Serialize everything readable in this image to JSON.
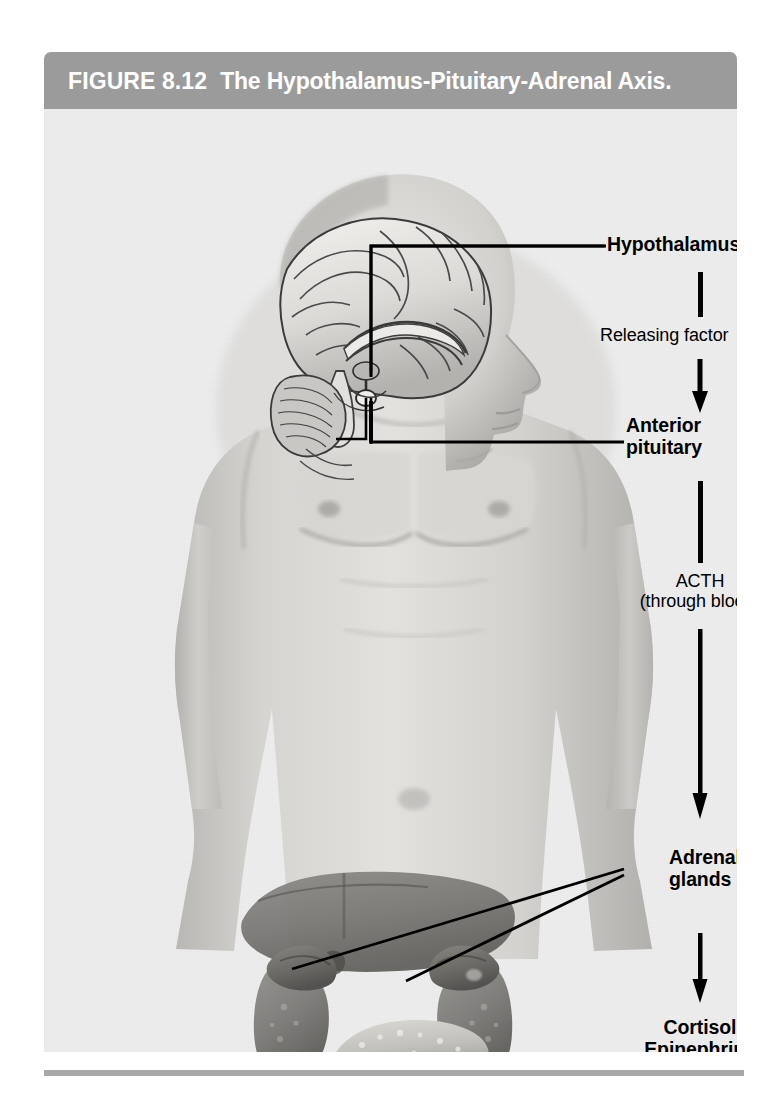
{
  "figure": {
    "number": "FIGURE 8.12",
    "title": "The Hypothalamus-Pituitary-Adrenal Axis.",
    "title_bar_color": "#9b9b9b",
    "background_color": "#eeeeee",
    "rule_color": "#a8a8a8"
  },
  "flow": {
    "steps": [
      {
        "id": "hypothalamus",
        "label": "Hypothalamus",
        "style": "bold",
        "kind": "organ"
      },
      {
        "id": "releasing-factor",
        "label": "Releasing factor",
        "style": "plain",
        "kind": "signal"
      },
      {
        "id": "anterior-pituitary",
        "label": "Anterior\npituitary",
        "style": "bold",
        "kind": "organ"
      },
      {
        "id": "acth",
        "label": "ACTH\n(through blood)",
        "style": "plain",
        "kind": "signal"
      },
      {
        "id": "adrenal-glands",
        "label": "Adrenal\nglands",
        "style": "bold",
        "kind": "organ"
      },
      {
        "id": "hormones",
        "label": "Cortisol\nEpinephrine\nNorepinephrine",
        "style": "bold",
        "kind": "output"
      }
    ],
    "connectors": [
      {
        "id": "hypothalamus-to-releasing-factor",
        "type": "bar"
      },
      {
        "id": "releasing-factor-to-pituitary",
        "type": "arrow"
      },
      {
        "id": "pituitary-to-acth",
        "type": "bar"
      },
      {
        "id": "acth-to-adrenal",
        "type": "arrow"
      },
      {
        "id": "adrenal-to-hormones",
        "type": "arrow"
      }
    ]
  },
  "leaders": [
    {
      "id": "hypothalamus-leader",
      "target": "hypothalamus"
    },
    {
      "id": "anterior-pituitary-leader",
      "target": "anterior pituitary"
    },
    {
      "id": "adrenal-gland-leader-left",
      "target": "left adrenal gland"
    },
    {
      "id": "adrenal-gland-leader-right",
      "target": "right adrenal gland"
    }
  ],
  "anatomy": {
    "subject": "male human figure, head and torso, anterior view",
    "structures": [
      "brain sagittal section",
      "cerebrum",
      "cerebellum",
      "brainstem",
      "hypothalamus",
      "pituitary gland",
      "liver",
      "left kidney",
      "right kidney",
      "left adrenal gland",
      "right adrenal gland",
      "pancreas"
    ]
  }
}
